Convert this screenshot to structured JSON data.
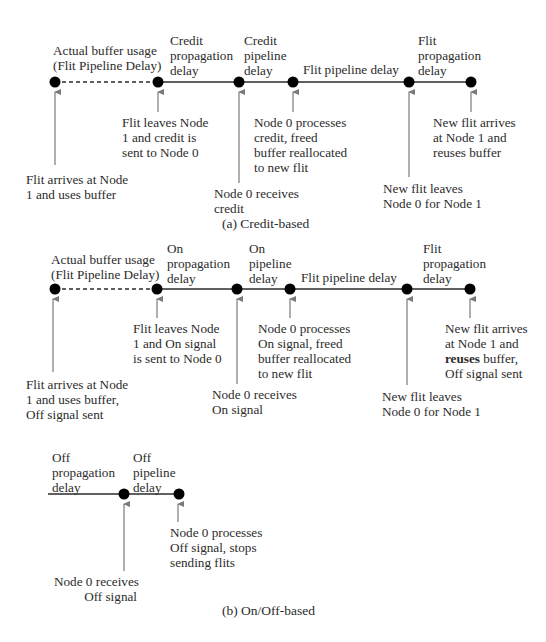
{
  "diagram_a": {
    "caption": "(a) Credit-based",
    "top_labels": [
      "Actual buffer usage\n(Flit Pipeline Delay)",
      "Credit\npropagation\ndelay",
      "Credit\npipeline\ndelay",
      "Flit pipeline delay",
      "Flit\npropagation\ndelay"
    ],
    "events": [
      "Flit arrives at Node\n1 and uses buffer",
      "Flit leaves Node\n1 and credit is\nsent to Node 0",
      "Node 0 receives\ncredit",
      "Node 0 processes\ncredit, freed\nbuffer reallocated\nto new flit",
      "New flit leaves\nNode 0 for Node 1",
      "New flit arrives\nat Node 1 and\nreuses buffer"
    ]
  },
  "diagram_b": {
    "caption": "(b) On/Off-based",
    "top_labels": [
      "Actual buffer usage\n(Flit Pipeline Delay)",
      "On\npropagation\ndelay",
      "On\npipeline\ndelay",
      "Flit pipeline delay",
      "Flit\npropagation\ndelay"
    ],
    "events": [
      "Flit arrives at Node\n1 and uses buffer,\nOff signal sent",
      "Flit leaves Node\n1 and On signal\nis sent to Node 0",
      "Node 0 receives\nOn signal",
      "Node 0 processes\nOn signal, freed\nbuffer reallocated\nto new flit",
      "New flit leaves\nNode 0 for Node 1",
      {
        "line1": "New flit arrives",
        "line2": "at Node 1 and",
        "bold": "reuses",
        "line3_rest": " buffer,",
        "line4": "Off signal sent"
      }
    ],
    "off": {
      "top_labels": [
        "Off\npropagation\ndelay",
        "Off\npipeline\ndelay"
      ],
      "events": [
        "Node 0 receives\nOff signal",
        "Node 0 processes\nOff signal, stops\nsending flits"
      ]
    }
  },
  "colors": {
    "line": "#2b2b2b",
    "dot": "#000000",
    "arrow": "#7a7a7a",
    "text": "#2b2b2b"
  }
}
